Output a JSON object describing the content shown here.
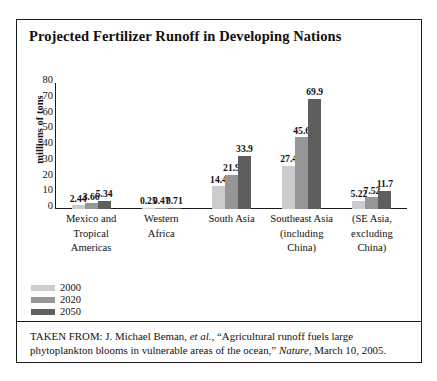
{
  "figure": {
    "title": "Projected Fertilizer Runoff in Developing Nations",
    "source_prefix": "TAKEN FROM: J. Michael Beman,",
    "source_etal": "et al.",
    "source_middle": ", “Agricultural runoff fuels large phytoplankton blooms in vulnerable areas of the ocean,”",
    "source_journal": "Nature",
    "source_suffix": ", March 10, 2005."
  },
  "colors": {
    "series_2000": "#cccccc",
    "series_2020": "#969696",
    "series_2050": "#5e5e5e",
    "axis": "#1a1a1a",
    "frame": "#1a1a1a",
    "background": "#ffffff"
  },
  "chart_data": {
    "type": "bar",
    "title": "Projected Fertilizer Runoff in Developing Nations",
    "xlabel": "",
    "ylabel": "millions of tons",
    "ylim": [
      0,
      80
    ],
    "yticks": [
      80,
      70,
      60,
      50,
      40,
      30,
      20,
      10,
      0
    ],
    "grid": false,
    "legend_position": "bottom-left",
    "categories": [
      "Mexico and Tropical Americas",
      "Western Africa",
      "South Asia",
      "Southeast Asia (including China)",
      "(SE Asia, excluding China)"
    ],
    "category_lines": [
      [
        "Mexico and",
        "Tropical",
        "Americas"
      ],
      [
        "Western",
        "Africa"
      ],
      [
        "South Asia"
      ],
      [
        "Southeast Asia",
        "(including",
        "China)"
      ],
      [
        "(SE Asia,",
        "excluding",
        "China)"
      ]
    ],
    "series": [
      {
        "name": "2000",
        "values": [
          2.44,
          0.25,
          14.4,
          27.4,
          5.22
        ]
      },
      {
        "name": "2020",
        "values": [
          3.66,
          0.47,
          21.9,
          45.6,
          7.52
        ]
      },
      {
        "name": "2050",
        "values": [
          5.34,
          0.71,
          33.9,
          69.9,
          11.7
        ]
      }
    ],
    "value_labels": [
      [
        "2.44",
        "3.66",
        "5.34"
      ],
      [
        "0.25",
        "0.47",
        "0.71"
      ],
      [
        "14.4",
        "21.9",
        "33.9"
      ],
      [
        "27.4",
        "45.6",
        "69.9"
      ],
      [
        "5.22",
        "7.52",
        "11.7"
      ]
    ]
  }
}
